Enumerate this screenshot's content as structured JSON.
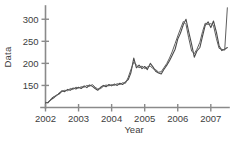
{
  "chart_data": {
    "type": "line",
    "title": "",
    "xlabel": "Year",
    "ylabel": "Data",
    "xlim": [
      2002.0,
      2007.55
    ],
    "ylim": [
      100,
      330
    ],
    "grid": false,
    "legend": null,
    "xticks": [
      2002,
      2003,
      2004,
      2005,
      2006,
      2007
    ],
    "xticklabels": [
      "2002",
      "2003",
      "2004",
      "2005",
      "2006",
      "2007"
    ],
    "yticks": [
      150,
      200,
      250,
      300
    ],
    "yticklabels": [
      "150",
      "200",
      "250",
      "300"
    ],
    "colors": {
      "series_1": "#4a4a4a",
      "series_2": "#5e5e5e",
      "axis": "#8a8a8a"
    },
    "x": [
      2002.0,
      2002.08,
      2002.17,
      2002.25,
      2002.33,
      2002.42,
      2002.5,
      2002.58,
      2002.67,
      2002.75,
      2002.83,
      2002.92,
      2003.0,
      2003.08,
      2003.17,
      2003.25,
      2003.33,
      2003.42,
      2003.5,
      2003.58,
      2003.67,
      2003.75,
      2003.83,
      2003.92,
      2004.0,
      2004.08,
      2004.17,
      2004.25,
      2004.33,
      2004.42,
      2004.5,
      2004.58,
      2004.67,
      2004.75,
      2004.83,
      2004.92,
      2005.0,
      2005.08,
      2005.17,
      2005.25,
      2005.33,
      2005.42,
      2005.5,
      2005.58,
      2005.67,
      2005.75,
      2005.83,
      2005.92,
      2006.0,
      2006.08,
      2006.17,
      2006.25,
      2006.33,
      2006.42,
      2006.5,
      2006.58,
      2006.67,
      2006.75,
      2006.83,
      2006.92,
      2007.0,
      2007.08,
      2007.17,
      2007.25,
      2007.33,
      2007.42,
      2007.5
    ],
    "series": [
      {
        "name": "series_1",
        "values": [
          110,
          112,
          118,
          122,
          128,
          131,
          138,
          136,
          141,
          139,
          144,
          142,
          146,
          143,
          149,
          145,
          151,
          148,
          143,
          139,
          146,
          150,
          147,
          152,
          149,
          153,
          150,
          155,
          152,
          158,
          163,
          178,
          212,
          190,
          196,
          188,
          193,
          186,
          200,
          192,
          182,
          178,
          176,
          186,
          196,
          206,
          218,
          232,
          255,
          268,
          288,
          300,
          272,
          243,
          214,
          228,
          236,
          262,
          286,
          294,
          281,
          296,
          270,
          240,
          229,
          232,
          236
        ]
      },
      {
        "name": "series_2",
        "values": [
          112,
          110,
          120,
          125,
          126,
          134,
          136,
          139,
          138,
          143,
          141,
          146,
          144,
          147,
          146,
          150,
          148,
          152,
          146,
          142,
          143,
          148,
          151,
          149,
          152,
          150,
          154,
          152,
          156,
          155,
          168,
          185,
          203,
          196,
          190,
          194,
          188,
          192,
          194,
          188,
          186,
          180,
          181,
          190,
          200,
          212,
          226,
          245,
          262,
          278,
          295,
          288,
          258,
          228,
          222,
          232,
          248,
          272,
          291,
          288,
          290,
          286,
          256,
          234,
          232,
          230,
          326
        ]
      }
    ]
  }
}
